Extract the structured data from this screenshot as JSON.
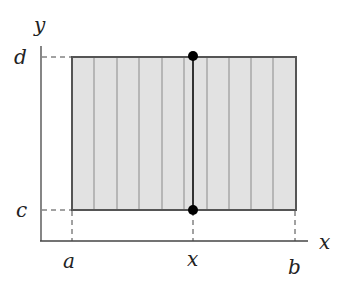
{
  "diagram": {
    "type": "integration-region-rectangle",
    "labels": {
      "y_axis": "y",
      "x_axis": "x",
      "top_bound": "d",
      "bottom_bound": "c",
      "left_bound": "a",
      "right_bound": "b",
      "slice_position": "x"
    },
    "colors": {
      "fill": "#e2e2e2",
      "border": "#555555",
      "strip_lines": "#8a8a8a",
      "slice_line": "#333333",
      "points": "#000000",
      "axes": "#444444"
    },
    "strip_count": 10
  }
}
